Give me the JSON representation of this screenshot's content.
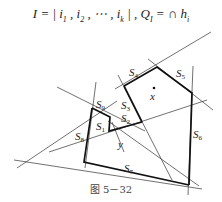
{
  "formula": {
    "text_left": "I = | i",
    "i_subs": [
      "1",
      "2",
      "k"
    ],
    "sep": " , ",
    "ellipsis": "⋯",
    "q_part": "Q",
    "q_sub": "I",
    "cap_symbol": "∩",
    "cap_under": "i∈I",
    "h": "h",
    "h_sub": "i"
  },
  "labels": {
    "S1": {
      "base": "S",
      "sub": "1"
    },
    "S2": {
      "base": "S",
      "sub": "2"
    },
    "S3": {
      "base": "S",
      "sub": "3"
    },
    "S4": {
      "base": "S",
      "sub": "4"
    },
    "S5": {
      "base": "S",
      "sub": "5"
    },
    "S6": {
      "base": "S",
      "sub": "6"
    },
    "S7": {
      "base": "S",
      "sub": "7"
    },
    "S8": {
      "base": "S",
      "sub": "8"
    },
    "S9": {
      "base": "S",
      "sub": "9"
    },
    "x": "x",
    "y": "y"
  },
  "caption": "图 5－32"
}
